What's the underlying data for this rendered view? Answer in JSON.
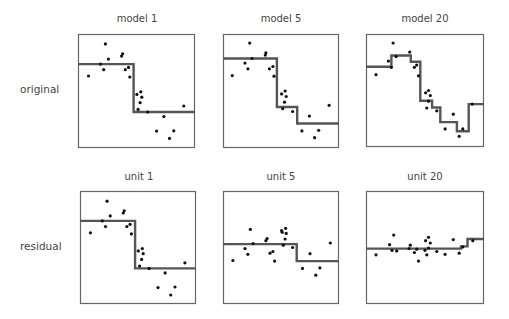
{
  "chart_data": {
    "type": "scatter",
    "layout": {
      "rows": 2,
      "cols": 3,
      "grid": false,
      "axes_ticks": false
    },
    "row_labels": [
      "original",
      "residual"
    ],
    "colors": {
      "line": "#555555",
      "point": "#111111",
      "frame": "#666666"
    },
    "panels": [
      {
        "title": "model 1",
        "row": 0,
        "col": 0,
        "points": [
          [
            0.234,
            0.087
          ],
          [
            0.26,
            0.22
          ],
          [
            0.381,
            0.174
          ],
          [
            0.373,
            0.194
          ],
          [
            0.192,
            0.264
          ],
          [
            0.22,
            0.313
          ],
          [
            0.09,
            0.368
          ],
          [
            0.404,
            0.313
          ],
          [
            0.432,
            0.293
          ],
          [
            0.443,
            0.377
          ],
          [
            0.503,
            0.53
          ],
          [
            0.537,
            0.507
          ],
          [
            0.545,
            0.554
          ],
          [
            0.531,
            0.603
          ],
          [
            0.514,
            0.661
          ],
          [
            0.596,
            0.684
          ],
          [
            0.904,
            0.632
          ],
          [
            0.734,
            0.725
          ],
          [
            0.672,
            0.852
          ],
          [
            0.819,
            0.849
          ],
          [
            0.782,
            0.916
          ]
        ],
        "step": [
          [
            0,
            0.264
          ],
          [
            0.475,
            0.264
          ],
          [
            0.475,
            0.684
          ],
          [
            1,
            0.684
          ]
        ]
      },
      {
        "title": "model 5",
        "row": 0,
        "col": 1,
        "points": [
          [
            0.23,
            0.08
          ],
          [
            0.25,
            0.215
          ],
          [
            0.37,
            0.165
          ],
          [
            0.365,
            0.185
          ],
          [
            0.19,
            0.255
          ],
          [
            0.215,
            0.305
          ],
          [
            0.08,
            0.365
          ],
          [
            0.4,
            0.305
          ],
          [
            0.43,
            0.285
          ],
          [
            0.44,
            0.37
          ],
          [
            0.505,
            0.525
          ],
          [
            0.535,
            0.5
          ],
          [
            0.545,
            0.548
          ],
          [
            0.53,
            0.598
          ],
          [
            0.515,
            0.655
          ],
          [
            0.6,
            0.68
          ],
          [
            0.915,
            0.625
          ],
          [
            0.745,
            0.72
          ],
          [
            0.68,
            0.85
          ],
          [
            0.825,
            0.845
          ],
          [
            0.79,
            0.91
          ]
        ],
        "step": [
          [
            0,
            0.215
          ],
          [
            0.465,
            0.215
          ],
          [
            0.465,
            0.64
          ],
          [
            0.64,
            0.64
          ],
          [
            0.64,
            0.785
          ],
          [
            1,
            0.785
          ]
        ]
      },
      {
        "title": "model 20",
        "row": 0,
        "col": 2,
        "points": [
          [
            0.23,
            0.08
          ],
          [
            0.255,
            0.2
          ],
          [
            0.37,
            0.16
          ],
          [
            0.19,
            0.24
          ],
          [
            0.215,
            0.295
          ],
          [
            0.085,
            0.36
          ],
          [
            0.41,
            0.295
          ],
          [
            0.43,
            0.275
          ],
          [
            0.445,
            0.37
          ],
          [
            0.505,
            0.52
          ],
          [
            0.53,
            0.5
          ],
          [
            0.545,
            0.545
          ],
          [
            0.53,
            0.595
          ],
          [
            0.515,
            0.655
          ],
          [
            0.6,
            0.68
          ],
          [
            0.9,
            0.62
          ],
          [
            0.74,
            0.71
          ],
          [
            0.67,
            0.84
          ],
          [
            0.82,
            0.84
          ],
          [
            0.79,
            0.905
          ]
        ],
        "step": [
          [
            0,
            0.29
          ],
          [
            0.215,
            0.29
          ],
          [
            0.215,
            0.19
          ],
          [
            0.38,
            0.19
          ],
          [
            0.38,
            0.245
          ],
          [
            0.46,
            0.245
          ],
          [
            0.46,
            0.59
          ],
          [
            0.56,
            0.59
          ],
          [
            0.56,
            0.65
          ],
          [
            0.63,
            0.65
          ],
          [
            0.63,
            0.78
          ],
          [
            0.77,
            0.78
          ],
          [
            0.77,
            0.86
          ],
          [
            0.87,
            0.86
          ],
          [
            0.87,
            0.62
          ],
          [
            1,
            0.62
          ]
        ]
      },
      {
        "title": "unit 1",
        "row": 1,
        "col": 0,
        "points": [
          [
            0.234,
            0.09
          ],
          [
            0.26,
            0.22
          ],
          [
            0.381,
            0.175
          ],
          [
            0.373,
            0.195
          ],
          [
            0.192,
            0.265
          ],
          [
            0.22,
            0.315
          ],
          [
            0.09,
            0.37
          ],
          [
            0.404,
            0.315
          ],
          [
            0.432,
            0.295
          ],
          [
            0.443,
            0.38
          ],
          [
            0.503,
            0.53
          ],
          [
            0.537,
            0.51
          ],
          [
            0.545,
            0.555
          ],
          [
            0.531,
            0.605
          ],
          [
            0.514,
            0.665
          ],
          [
            0.596,
            0.685
          ],
          [
            0.904,
            0.635
          ],
          [
            0.734,
            0.725
          ],
          [
            0.672,
            0.855
          ],
          [
            0.819,
            0.85
          ],
          [
            0.782,
            0.92
          ]
        ],
        "step": [
          [
            0,
            0.265
          ],
          [
            0.475,
            0.265
          ],
          [
            0.475,
            0.685
          ],
          [
            1,
            0.685
          ]
        ]
      },
      {
        "title": "unit 5",
        "row": 1,
        "col": 1,
        "points": [
          [
            0.235,
            0.34
          ],
          [
            0.26,
            0.465
          ],
          [
            0.38,
            0.42
          ],
          [
            0.37,
            0.44
          ],
          [
            0.19,
            0.51
          ],
          [
            0.215,
            0.56
          ],
          [
            0.085,
            0.615
          ],
          [
            0.405,
            0.55
          ],
          [
            0.43,
            0.535
          ],
          [
            0.445,
            0.62
          ],
          [
            0.505,
            0.35
          ],
          [
            0.54,
            0.33
          ],
          [
            0.545,
            0.375
          ],
          [
            0.535,
            0.425
          ],
          [
            0.52,
            0.48
          ],
          [
            0.6,
            0.5
          ],
          [
            0.925,
            0.46
          ],
          [
            0.75,
            0.555
          ],
          [
            0.685,
            0.685
          ],
          [
            0.835,
            0.68
          ],
          [
            0.8,
            0.745
          ],
          [
            0.51,
            0.365
          ]
        ],
        "step": [
          [
            0,
            0.47
          ],
          [
            0.635,
            0.47
          ],
          [
            0.635,
            0.62
          ],
          [
            1,
            0.62
          ]
        ]
      },
      {
        "title": "unit 20",
        "row": 1,
        "col": 2,
        "points": [
          [
            0.235,
            0.39
          ],
          [
            0.2,
            0.475
          ],
          [
            0.22,
            0.525
          ],
          [
            0.26,
            0.53
          ],
          [
            0.085,
            0.565
          ],
          [
            0.375,
            0.48
          ],
          [
            0.41,
            0.545
          ],
          [
            0.43,
            0.515
          ],
          [
            0.445,
            0.62
          ],
          [
            0.505,
            0.44
          ],
          [
            0.53,
            0.41
          ],
          [
            0.545,
            0.46
          ],
          [
            0.53,
            0.505
          ],
          [
            0.515,
            0.565
          ],
          [
            0.6,
            0.535
          ],
          [
            0.74,
            0.43
          ],
          [
            0.67,
            0.56
          ],
          [
            0.79,
            0.55
          ],
          [
            0.82,
            0.495
          ],
          [
            0.905,
            0.44
          ],
          [
            0.365,
            0.51
          ],
          [
            0.5,
            0.525
          ]
        ],
        "step": [
          [
            0,
            0.51
          ],
          [
            0.805,
            0.51
          ],
          [
            0.805,
            0.49
          ],
          [
            0.86,
            0.49
          ],
          [
            0.86,
            0.425
          ],
          [
            1,
            0.425
          ]
        ]
      }
    ],
    "xlabel": "",
    "ylabel": ""
  },
  "figure": {
    "titles": [
      "model 1",
      "model 5",
      "model 20",
      "unit 1",
      "unit 5",
      "unit 20"
    ],
    "row_labels": [
      "original",
      "residual"
    ]
  }
}
